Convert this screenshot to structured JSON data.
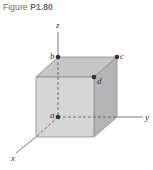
{
  "figure": {
    "caption_prefix": "Figure ",
    "caption_number": "P1.80"
  },
  "axes": {
    "x_label": "x",
    "y_label": "y",
    "z_label": "z"
  },
  "points": {
    "a": "a",
    "b": "b",
    "c": "c",
    "d": "d"
  },
  "colors": {
    "front_face": "#d4d4d4",
    "top_face": "#c4c4c4",
    "side_face": "#b3b3b3",
    "edge": "#7a7a7a",
    "point": "#333333",
    "axis": "#555555"
  }
}
